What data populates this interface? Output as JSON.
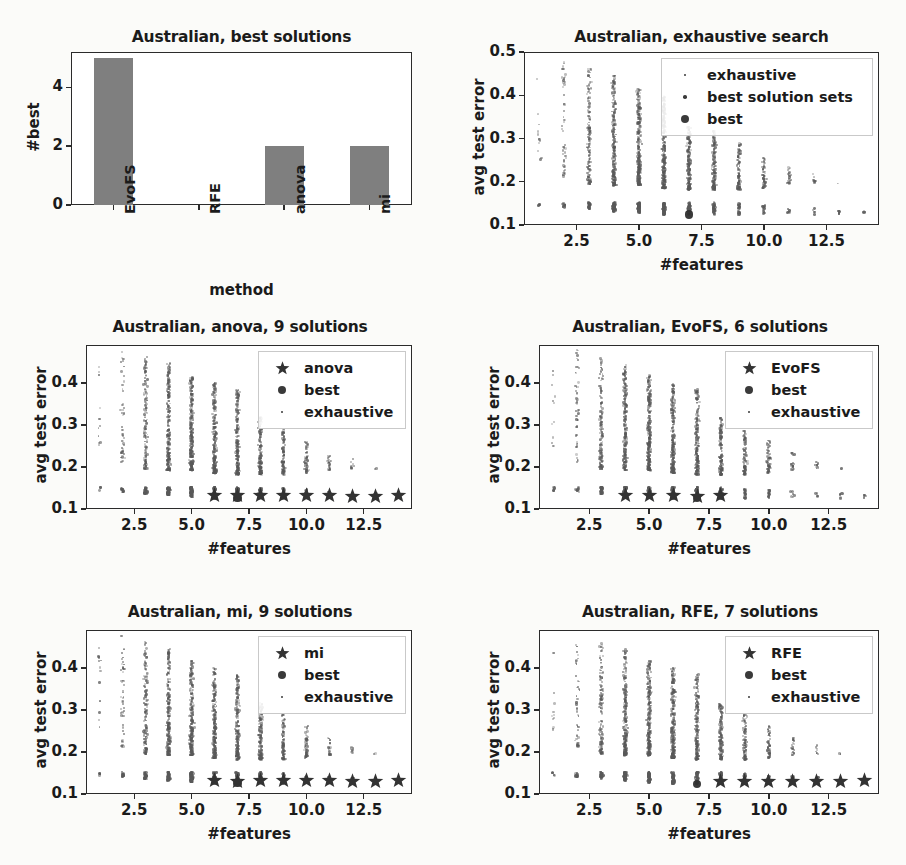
{
  "figure": {
    "dataset": "Australian",
    "bg_color": "#fbfbf9",
    "marker_color": "#595959",
    "bar_color": "#7f7f7f"
  },
  "chart_data": [
    {
      "id": "best-solutions",
      "type": "bar",
      "title": "Australian, best solutions",
      "xlabel": "method",
      "ylabel": "#best",
      "categories": [
        "EvoFS",
        "RFE",
        "anova",
        "mi"
      ],
      "values": [
        5,
        0,
        2,
        2
      ],
      "ylim": [
        0,
        5.2
      ],
      "yticks": [
        0,
        2,
        4
      ],
      "ytick_labels": [
        "0",
        "2",
        "4"
      ],
      "grid": false,
      "legend": null
    },
    {
      "id": "exhaustive-search",
      "type": "scatter",
      "title": "Australian, exhaustive search",
      "xlabel": "#features",
      "ylabel": "avg test error",
      "xlim": [
        0.4,
        14.6
      ],
      "ylim": [
        0.1,
        0.5
      ],
      "xticks": [
        2.5,
        5.0,
        7.5,
        10.0,
        12.5
      ],
      "xtick_labels": [
        "2.5",
        "5.0",
        "7.5",
        "10.0",
        "12.5"
      ],
      "yticks": [
        0.1,
        0.2,
        0.3,
        0.4,
        0.5
      ],
      "ytick_labels": [
        "0.1",
        "0.2",
        "0.3",
        "0.4",
        "0.5"
      ],
      "grid": false,
      "legend": {
        "position": "upper right",
        "entries": [
          {
            "label": "exhaustive",
            "marker": "tiny-dot"
          },
          {
            "label": "best solution sets",
            "marker": "small-dot"
          },
          {
            "label": "best",
            "marker": "large-dot"
          }
        ]
      },
      "series": [
        {
          "name": "exhaustive",
          "marker": "dot",
          "x": [
            1,
            2,
            3,
            4,
            5,
            6,
            7,
            8,
            9,
            10,
            11,
            12,
            13,
            14
          ],
          "cloud_top": [
            0.452,
            0.478,
            0.463,
            0.446,
            0.418,
            0.4,
            0.327,
            0.318,
            0.29,
            0.263,
            0.234,
            0.219,
            0.196,
            0.132
          ],
          "cloud_bottom": [
            0.25,
            0.212,
            0.195,
            0.192,
            0.192,
            0.185,
            0.182,
            0.182,
            0.182,
            0.186,
            0.192,
            0.196,
            0.196,
            0.132
          ],
          "cloud_density": [
            12,
            48,
            150,
            260,
            300,
            280,
            230,
            170,
            110,
            62,
            26,
            10,
            2,
            1
          ]
        },
        {
          "name": "best solution sets",
          "marker": "dot",
          "x": [
            1,
            2,
            3,
            4,
            5,
            6,
            7,
            8,
            9,
            10,
            11,
            12,
            13,
            14
          ],
          "band_top": [
            0.146,
            0.15,
            0.15,
            0.152,
            0.152,
            0.152,
            0.152,
            0.15,
            0.148,
            0.145,
            0.142,
            0.138,
            0.134,
            0.131
          ],
          "band_bottom": [
            0.143,
            0.146,
            0.14,
            0.132,
            0.13,
            0.128,
            0.124,
            0.126,
            0.128,
            0.129,
            0.13,
            0.131,
            0.131,
            0.131
          ]
        },
        {
          "name": "best",
          "marker": "large-dot",
          "x": [
            7
          ],
          "y": [
            0.124
          ]
        }
      ]
    },
    {
      "id": "anova",
      "type": "scatter",
      "title": "Australian, anova, 9 solutions",
      "xlabel": "#features",
      "ylabel": "avg test error",
      "xlim": [
        0.4,
        14.6
      ],
      "ylim": [
        0.1,
        0.49
      ],
      "xticks": [
        2.5,
        5.0,
        7.5,
        10.0,
        12.5
      ],
      "xtick_labels": [
        "2.5",
        "5.0",
        "7.5",
        "10.0",
        "12.5"
      ],
      "yticks": [
        0.1,
        0.2,
        0.3,
        0.4
      ],
      "ytick_labels": [
        "0.1",
        "0.2",
        "0.3",
        "0.4"
      ],
      "grid": false,
      "legend": {
        "position": "upper right",
        "entries": [
          {
            "label": "anova",
            "marker": "star"
          },
          {
            "label": "best",
            "marker": "large-dot"
          },
          {
            "label": "exhaustive",
            "marker": "tiny-dot"
          }
        ]
      },
      "series": [
        {
          "name": "exhaustive",
          "marker": "dot",
          "x": [
            1,
            2,
            3,
            4,
            5,
            6,
            7,
            8,
            9,
            10,
            11,
            12,
            13,
            14
          ],
          "cloud_top": [
            0.452,
            0.478,
            0.463,
            0.446,
            0.418,
            0.4,
            0.384,
            0.318,
            0.29,
            0.263,
            0.234,
            0.219,
            0.196,
            0.132
          ],
          "cloud_bottom": [
            0.25,
            0.212,
            0.195,
            0.192,
            0.192,
            0.185,
            0.182,
            0.182,
            0.182,
            0.186,
            0.192,
            0.196,
            0.196,
            0.132
          ],
          "cloud_density": [
            12,
            48,
            150,
            260,
            300,
            280,
            230,
            170,
            110,
            62,
            26,
            10,
            2,
            1
          ]
        },
        {
          "name": "best",
          "marker": "large-dot",
          "x": [
            7
          ],
          "y": [
            0.126
          ]
        },
        {
          "name": "anova",
          "marker": "star",
          "x": [
            6,
            7,
            8,
            9,
            10,
            11,
            12,
            13,
            14
          ],
          "y": [
            0.133,
            0.131,
            0.133,
            0.132,
            0.131,
            0.131,
            0.13,
            0.13,
            0.131
          ]
        }
      ]
    },
    {
      "id": "evofs",
      "type": "scatter",
      "title": "Australian, EvoFS, 6 solutions",
      "xlabel": "#features",
      "ylabel": "avg test error",
      "xlim": [
        0.4,
        14.6
      ],
      "ylim": [
        0.1,
        0.49
      ],
      "xticks": [
        2.5,
        5.0,
        7.5,
        10.0,
        12.5
      ],
      "xtick_labels": [
        "2.5",
        "5.0",
        "7.5",
        "10.0",
        "12.5"
      ],
      "yticks": [
        0.1,
        0.2,
        0.3,
        0.4
      ],
      "ytick_labels": [
        "0.1",
        "0.2",
        "0.3",
        "0.4"
      ],
      "grid": false,
      "legend": {
        "position": "upper right",
        "entries": [
          {
            "label": "EvoFS",
            "marker": "star"
          },
          {
            "label": "best",
            "marker": "large-dot"
          },
          {
            "label": "exhaustive",
            "marker": "tiny-dot"
          }
        ]
      },
      "series": [
        {
          "name": "exhaustive",
          "marker": "dot",
          "x": [
            1,
            2,
            3,
            4,
            5,
            6,
            7,
            8,
            9,
            10,
            11,
            12,
            13,
            14
          ],
          "cloud_top": [
            0.452,
            0.478,
            0.463,
            0.446,
            0.418,
            0.4,
            0.384,
            0.318,
            0.29,
            0.263,
            0.234,
            0.219,
            0.196,
            0.132
          ],
          "cloud_bottom": [
            0.25,
            0.212,
            0.195,
            0.192,
            0.192,
            0.185,
            0.182,
            0.182,
            0.182,
            0.186,
            0.192,
            0.196,
            0.196,
            0.132
          ],
          "cloud_density": [
            12,
            48,
            150,
            260,
            300,
            280,
            230,
            170,
            110,
            62,
            26,
            10,
            2,
            1
          ]
        },
        {
          "name": "best",
          "marker": "large-dot",
          "x": [
            7
          ],
          "y": [
            0.126
          ]
        },
        {
          "name": "EvoFS",
          "marker": "star",
          "x": [
            4,
            5,
            6,
            7,
            8
          ],
          "y": [
            0.133,
            0.131,
            0.132,
            0.129,
            0.132
          ]
        }
      ]
    },
    {
      "id": "mi",
      "type": "scatter",
      "title": "Australian, mi, 9 solutions",
      "xlabel": "#features",
      "ylabel": "avg test error",
      "xlim": [
        0.4,
        14.6
      ],
      "ylim": [
        0.1,
        0.49
      ],
      "xticks": [
        2.5,
        5.0,
        7.5,
        10.0,
        12.5
      ],
      "xtick_labels": [
        "2.5",
        "5.0",
        "7.5",
        "10.0",
        "12.5"
      ],
      "yticks": [
        0.1,
        0.2,
        0.3,
        0.4
      ],
      "ytick_labels": [
        "0.1",
        "0.2",
        "0.3",
        "0.4"
      ],
      "grid": false,
      "legend": {
        "position": "upper right",
        "entries": [
          {
            "label": "mi",
            "marker": "star"
          },
          {
            "label": "best",
            "marker": "large-dot"
          },
          {
            "label": "exhaustive",
            "marker": "tiny-dot"
          }
        ]
      },
      "series": [
        {
          "name": "exhaustive",
          "marker": "dot",
          "x": [
            1,
            2,
            3,
            4,
            5,
            6,
            7,
            8,
            9,
            10,
            11,
            12,
            13,
            14
          ],
          "cloud_top": [
            0.452,
            0.478,
            0.463,
            0.446,
            0.418,
            0.4,
            0.384,
            0.318,
            0.29,
            0.263,
            0.234,
            0.219,
            0.196,
            0.132
          ],
          "cloud_bottom": [
            0.25,
            0.212,
            0.195,
            0.192,
            0.192,
            0.185,
            0.182,
            0.182,
            0.182,
            0.186,
            0.192,
            0.196,
            0.196,
            0.132
          ],
          "cloud_density": [
            12,
            48,
            150,
            260,
            300,
            280,
            230,
            170,
            110,
            62,
            26,
            10,
            2,
            1
          ]
        },
        {
          "name": "best",
          "marker": "large-dot",
          "x": [
            7
          ],
          "y": [
            0.126
          ]
        },
        {
          "name": "mi",
          "marker": "star",
          "x": [
            6,
            7,
            8,
            9,
            10,
            11,
            12,
            13,
            14
          ],
          "y": [
            0.133,
            0.13,
            0.132,
            0.131,
            0.131,
            0.131,
            0.13,
            0.13,
            0.131
          ]
        }
      ]
    },
    {
      "id": "rfe",
      "type": "scatter",
      "title": "Australian, RFE, 7 solutions",
      "xlabel": "#features",
      "ylabel": "avg test error",
      "xlim": [
        0.4,
        14.6
      ],
      "ylim": [
        0.1,
        0.49
      ],
      "xticks": [
        2.5,
        5.0,
        7.5,
        10.0,
        12.5
      ],
      "xtick_labels": [
        "2.5",
        "5.0",
        "7.5",
        "10.0",
        "12.5"
      ],
      "yticks": [
        0.1,
        0.2,
        0.3,
        0.4
      ],
      "ytick_labels": [
        "0.1",
        "0.2",
        "0.3",
        "0.4"
      ],
      "grid": false,
      "legend": {
        "position": "upper right",
        "entries": [
          {
            "label": "RFE",
            "marker": "star"
          },
          {
            "label": "best",
            "marker": "large-dot"
          },
          {
            "label": "exhaustive",
            "marker": "tiny-dot"
          }
        ]
      },
      "series": [
        {
          "name": "exhaustive",
          "marker": "dot",
          "x": [
            1,
            2,
            3,
            4,
            5,
            6,
            7,
            8,
            9,
            10,
            11,
            12,
            13,
            14
          ],
          "cloud_top": [
            0.452,
            0.478,
            0.463,
            0.446,
            0.418,
            0.4,
            0.384,
            0.318,
            0.29,
            0.263,
            0.234,
            0.219,
            0.196,
            0.132
          ],
          "cloud_bottom": [
            0.25,
            0.212,
            0.195,
            0.192,
            0.192,
            0.185,
            0.182,
            0.182,
            0.182,
            0.186,
            0.192,
            0.196,
            0.196,
            0.132
          ],
          "cloud_density": [
            12,
            48,
            150,
            260,
            300,
            280,
            230,
            170,
            110,
            62,
            26,
            10,
            2,
            1
          ]
        },
        {
          "name": "best",
          "marker": "large-dot",
          "x": [
            7
          ],
          "y": [
            0.124
          ]
        },
        {
          "name": "RFE",
          "marker": "star",
          "x": [
            8,
            9,
            10,
            11,
            12,
            13,
            14
          ],
          "y": [
            0.129,
            0.13,
            0.13,
            0.13,
            0.13,
            0.13,
            0.131
          ]
        }
      ]
    }
  ]
}
